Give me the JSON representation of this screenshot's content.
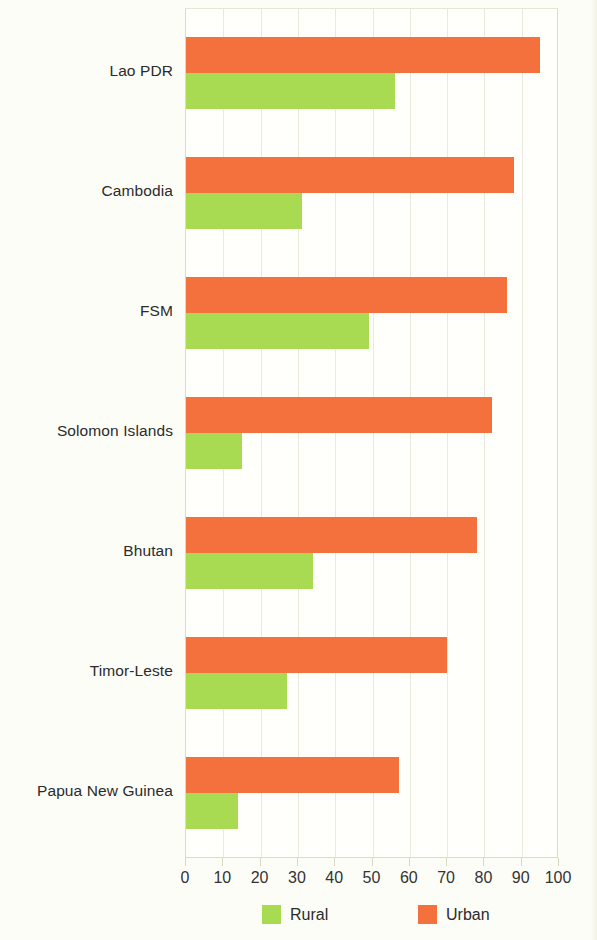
{
  "chart_data": {
    "type": "bar",
    "orientation": "horizontal",
    "title": "",
    "subtitle": "",
    "xlabel": "",
    "ylabel": "",
    "xlim": [
      0,
      100
    ],
    "grid": true,
    "legend_position": "bottom",
    "categories": [
      "Lao PDR",
      "Cambodia",
      "FSM",
      "Solomon Islands",
      "Bhutan",
      "Timor-Leste",
      "Papua New Guinea"
    ],
    "series": [
      {
        "name": "Urban",
        "color": "#F4703C",
        "values": [
          95,
          88,
          86,
          82,
          78,
          70,
          57
        ]
      },
      {
        "name": "Rural",
        "color": "#A8DB52",
        "values": [
          56,
          31,
          49,
          15,
          34,
          27,
          14
        ]
      }
    ],
    "x_ticks": [
      0,
      10,
      20,
      30,
      40,
      50,
      60,
      70,
      80,
      90,
      100
    ],
    "x_tick_labels": [
      "0",
      "10",
      "20",
      "30",
      "40",
      "50",
      "60",
      "70",
      "80",
      "90",
      "100"
    ]
  },
  "legend": {
    "items": [
      {
        "label": "Rural",
        "color": "#A8DB52"
      },
      {
        "label": "Urban",
        "color": "#F4703C"
      }
    ]
  },
  "colors": {
    "urban": "#F4703C",
    "rural": "#A8DB52",
    "gridline": "#e9e9dc",
    "axis": "#dcdcc8",
    "text": "#2b2b2b",
    "background": "#fdfdf8"
  }
}
